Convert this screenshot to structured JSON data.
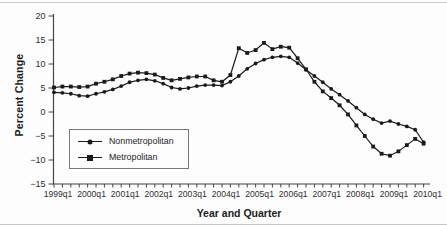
{
  "figure": {
    "y_axis_title": "Percent Change",
    "x_axis_title": "Year and Quarter"
  },
  "legend": {
    "items": [
      {
        "label": "Nonmetropolitan",
        "marker": "circle"
      },
      {
        "label": "Metropolitan",
        "marker": "square"
      }
    ]
  },
  "colors": {
    "line": "#1a1a1a",
    "marker": "#1a1a1a",
    "axis": "#444444",
    "tick_text": "#2e2e2e",
    "background": "#fdfdfd",
    "document_rule": "#c9c9c9"
  },
  "chart_data": {
    "type": "line",
    "x": [
      "1999q1",
      "1999q2",
      "1999q3",
      "1999q4",
      "2000q1",
      "2000q2",
      "2000q3",
      "2000q4",
      "2001q1",
      "2001q2",
      "2001q3",
      "2001q4",
      "2002q1",
      "2002q2",
      "2002q3",
      "2002q4",
      "2003q1",
      "2003q2",
      "2003q3",
      "2003q4",
      "2004q1",
      "2004q2",
      "2004q3",
      "2004q4",
      "2005q1",
      "2005q2",
      "2005q3",
      "2005q4",
      "2006q1",
      "2006q2",
      "2006q3",
      "2006q4",
      "2007q1",
      "2007q2",
      "2007q3",
      "2007q4",
      "2008q1",
      "2008q2",
      "2008q3",
      "2008q4",
      "2009q1",
      "2009q2",
      "2009q3",
      "2009q4",
      "2010q1"
    ],
    "x_tick_labels": [
      "1999q1",
      "2000q1",
      "2001q1",
      "2002q1",
      "2003q1",
      "2004q1",
      "2005q1",
      "2006q1",
      "2007q1",
      "2008q1",
      "2009q1",
      "2010q1"
    ],
    "y_tick_values": [
      20,
      15,
      10,
      5,
      0,
      -5,
      -10,
      -15
    ],
    "y_tick_labels": [
      "20",
      "15",
      "10",
      "5",
      "0",
      "−5",
      "−10",
      "−15"
    ],
    "ylim": [
      -15,
      20
    ],
    "xlabel": "Year and Quarter",
    "ylabel": "Percent Change",
    "title": "",
    "grid": false,
    "legend_position": "lower-left-inside",
    "series": [
      {
        "name": "Nonmetropolitan",
        "marker": "circle",
        "values": [
          4.1,
          4.0,
          3.8,
          3.4,
          3.3,
          3.8,
          4.2,
          4.7,
          5.4,
          6.2,
          6.6,
          6.8,
          6.5,
          5.9,
          5.1,
          4.8,
          5.0,
          5.4,
          5.6,
          5.6,
          5.5,
          6.3,
          7.5,
          9.0,
          10.1,
          10.9,
          11.4,
          11.6,
          11.4,
          10.2,
          8.8,
          7.5,
          6.2,
          4.8,
          3.6,
          2.3,
          0.9,
          -0.5,
          -1.5,
          -2.3,
          -1.9,
          -2.5,
          -3.0,
          -3.7,
          -6.3
        ]
      },
      {
        "name": "Metropolitan",
        "marker": "square",
        "values": [
          5.1,
          5.3,
          5.3,
          5.2,
          5.3,
          5.9,
          6.3,
          6.8,
          7.5,
          8.0,
          8.2,
          8.1,
          7.8,
          7.1,
          6.6,
          6.9,
          7.2,
          7.4,
          7.4,
          6.6,
          6.3,
          7.7,
          13.3,
          12.3,
          12.9,
          14.4,
          13.1,
          13.6,
          13.4,
          11.2,
          8.9,
          6.3,
          4.3,
          2.9,
          1.4,
          -0.5,
          -2.8,
          -5.0,
          -7.2,
          -8.7,
          -9.1,
          -8.2,
          -6.9,
          -5.6,
          -6.6
        ]
      }
    ]
  }
}
